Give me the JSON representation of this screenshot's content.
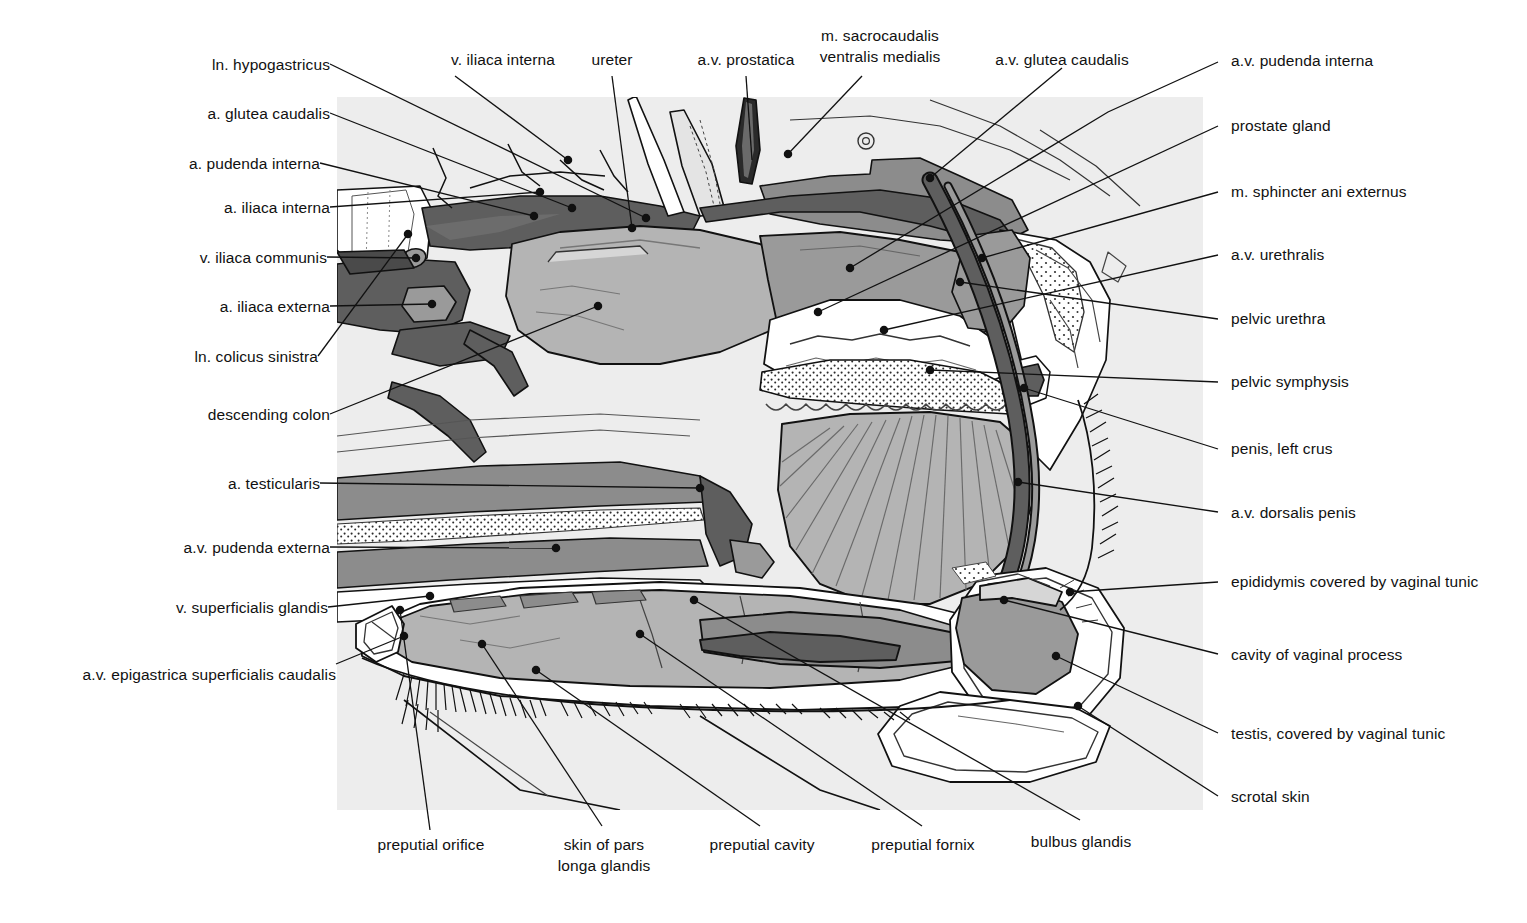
{
  "figure": {
    "kind": "anatomical-illustration",
    "background_color": "#ededed",
    "ink_color": "#111111",
    "palette": {
      "paper": "#ffffff",
      "field": "#ededed",
      "tissue_light": "#d6d6d6",
      "tissue_mid": "#b4b4b4",
      "tissue_gray": "#9a9a9a",
      "muscle": "#8c8c8c",
      "vessel_dark": "#5e5e5e",
      "vessel_darker": "#4a4a4a",
      "outline": "#111111"
    }
  },
  "labels_left": [
    {
      "id": "ln-hypogastricus",
      "text": "ln. hypogastricus"
    },
    {
      "id": "a-glutea-caudalis",
      "text": "a. glutea caudalis"
    },
    {
      "id": "a-pudenda-interna",
      "text": "a. pudenda interna"
    },
    {
      "id": "a-iliaca-interna",
      "text": "a. iliaca interna"
    },
    {
      "id": "v-iliaca-communis",
      "text": "v. iliaca communis"
    },
    {
      "id": "a-iliaca-externa",
      "text": "a. iliaca externa"
    },
    {
      "id": "ln-colicus-sinistra",
      "text": "ln. colicus sinistra"
    },
    {
      "id": "descending-colon",
      "text": "descending colon"
    },
    {
      "id": "a-testicularis",
      "text": "a. testicularis"
    },
    {
      "id": "av-pudenda-externa",
      "text": "a.v. pudenda externa"
    },
    {
      "id": "v-superficialis-glandis",
      "text": "v. superficialis glandis"
    },
    {
      "id": "av-epigastrica-superficialis-caudalis",
      "text": "a.v. epigastrica superficialis caudalis"
    }
  ],
  "labels_top": [
    {
      "id": "v-iliaca-interna",
      "text": "v. iliaca interna"
    },
    {
      "id": "ureter",
      "text": "ureter"
    },
    {
      "id": "av-prostatica",
      "text": "a.v. prostatica"
    },
    {
      "id": "m-sacrocaudalis",
      "text": "m. sacrocaudalis",
      "text2": "ventralis medialis"
    },
    {
      "id": "av-glutea-caudalis",
      "text": "a.v. glutea caudalis"
    }
  ],
  "labels_right": [
    {
      "id": "av-pudenda-interna",
      "text": "a.v. pudenda interna"
    },
    {
      "id": "prostate-gland",
      "text": "prostate gland"
    },
    {
      "id": "m-sphincter-ani-externus",
      "text": "m. sphincter ani externus"
    },
    {
      "id": "av-urethralis",
      "text": "a.v. urethralis"
    },
    {
      "id": "pelvic-urethra",
      "text": "pelvic urethra"
    },
    {
      "id": "pelvic-symphysis",
      "text": "pelvic symphysis"
    },
    {
      "id": "penis-left-crus",
      "text": "penis, left crus"
    },
    {
      "id": "av-dorsalis-penis",
      "text": "a.v. dorsalis penis"
    },
    {
      "id": "epididymis-vaginal-tunic",
      "text": "epididymis covered by vaginal tunic"
    },
    {
      "id": "cavity-of-vaginal-process",
      "text": "cavity of vaginal process"
    },
    {
      "id": "testis-vaginal-tunic",
      "text": "testis, covered by vaginal tunic"
    },
    {
      "id": "scrotal-skin",
      "text": "scrotal skin"
    }
  ],
  "labels_bottom": [
    {
      "id": "preputial-orifice",
      "text": "preputial orifice"
    },
    {
      "id": "skin-of-pars-longa",
      "text": "skin of pars",
      "text2": "longa glandis"
    },
    {
      "id": "preputial-cavity",
      "text": "preputial cavity"
    },
    {
      "id": "preputial-fornix",
      "text": "preputial fornix"
    },
    {
      "id": "bulbus-glandis",
      "text": "bulbus glandis"
    }
  ]
}
